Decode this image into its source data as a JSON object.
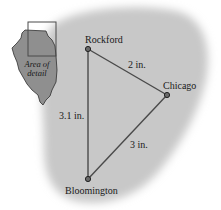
{
  "diagram": {
    "type": "map-triangle",
    "colors": {
      "background": "#ffffff",
      "region_fill": "#c8c8c8",
      "state_fill": "#8f8f8f",
      "line": "#4a4a4a",
      "point": "#3a3a3a"
    },
    "inset": {
      "state": "Illinois",
      "caption_line1": "Area of",
      "caption_line2": "detail"
    },
    "cities": [
      {
        "name": "Rockford",
        "x": 88,
        "y": 49
      },
      {
        "name": "Chicago",
        "x": 167,
        "y": 95
      },
      {
        "name": "Bloomington",
        "x": 88,
        "y": 179
      }
    ],
    "edges": [
      {
        "from": "Rockford",
        "to": "Chicago",
        "label": "2 in."
      },
      {
        "from": "Chicago",
        "to": "Bloomington",
        "label": "3 in."
      },
      {
        "from": "Rockford",
        "to": "Bloomington",
        "label": "3.1 in."
      }
    ]
  }
}
